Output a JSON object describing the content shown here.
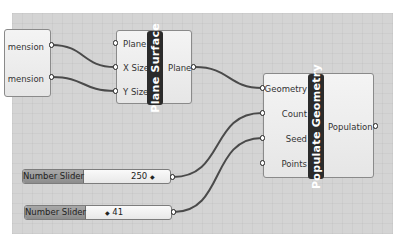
{
  "canvas": {
    "background": "#d4d4d4",
    "wire_color": "#4a4a4a"
  },
  "components": {
    "dimension_partial": {
      "outputs": [
        "mension",
        "mension"
      ]
    },
    "plane_surface": {
      "title": "Plane Surface",
      "inputs": [
        "Plane",
        "X Size",
        "Y Size"
      ],
      "outputs": [
        "Plane"
      ]
    },
    "populate_geometry": {
      "title": "Populate Geometry",
      "inputs": [
        "Geometry",
        "Count",
        "Seed",
        "Points"
      ],
      "outputs": [
        "Population"
      ]
    }
  },
  "sliders": [
    {
      "label": "Number Slider",
      "value": "250",
      "handle_icon": "◆"
    },
    {
      "label": "Number Slider",
      "value": "41",
      "handle_icon": "◆"
    }
  ]
}
